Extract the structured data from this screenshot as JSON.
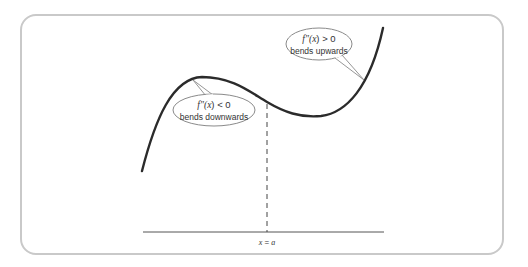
{
  "diagram": {
    "type": "function-concavity",
    "curve": {
      "shape": "cubic",
      "color": "#2b2b2b"
    },
    "axis": {
      "label": "x = a",
      "label_var": "x",
      "label_eq": " = ",
      "label_val": "a"
    },
    "callouts": [
      {
        "id": "concave-down",
        "expr_fn": "f″(",
        "expr_var": "x",
        "expr_rest": ") < 0",
        "text": "bends downwards"
      },
      {
        "id": "concave-up",
        "expr_fn": "f″(",
        "expr_var": "x",
        "expr_rest": ") > 0",
        "text": "bends upwards"
      }
    ],
    "colors": {
      "frame": "#c9c9c9",
      "line": "#2b2b2b",
      "bubble_stroke": "#8a8a8a",
      "text": "#333333"
    }
  }
}
